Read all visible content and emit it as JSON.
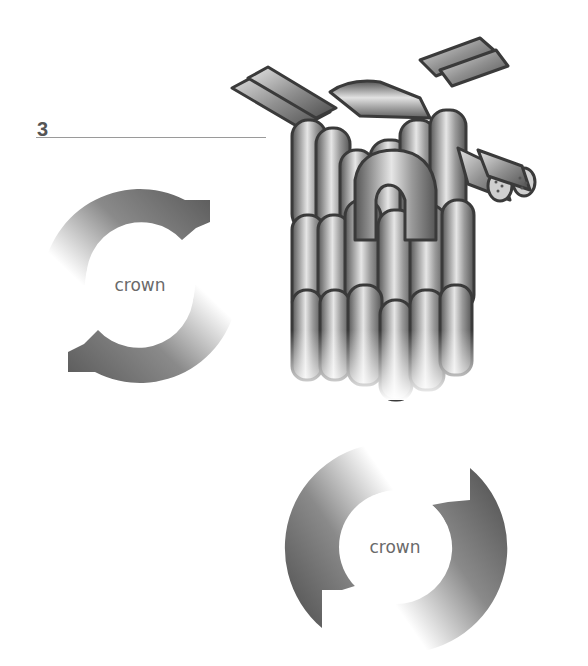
{
  "step": {
    "number": "3"
  },
  "diagrams": {
    "crown_cycle_left": {
      "label": "crown",
      "direction": "clockwise",
      "icon": "circular-arrow-icon"
    },
    "crown_cycle_right": {
      "label": "crown",
      "direction": "clockwise",
      "icon": "circular-arrow-icon"
    },
    "knot_illustration": {
      "icon": "crown-knot-illustration",
      "description": "Two-strand cord tied in stacked crown knots"
    }
  },
  "colors": {
    "arrow_dark": "#5a5a5a",
    "arrow_light": "#ffffff",
    "cord_dark": "#4a4a4a",
    "cord_mid": "#9a9a9a",
    "cord_light": "#e0e0e0",
    "outline": "#3a3a3a",
    "rule": "#9a9a9a",
    "text": "#6a6a6a"
  }
}
